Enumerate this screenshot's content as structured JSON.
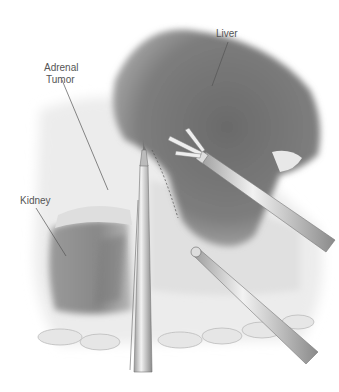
{
  "figure": {
    "type": "anatomical-surgical-illustration",
    "labels": {
      "liver": "Liver",
      "adrenal_tumor_line1": "Adrenal",
      "adrenal_tumor_line2": "Tumor",
      "kidney": "Kidney"
    },
    "colors": {
      "background": "#ffffff",
      "organ_dark": "#6e6e6e",
      "organ_mid": "#9a9a9a",
      "tissue_light": "#e4e4e4",
      "instrument": "#cfcfcf",
      "label_text": "#555555"
    }
  }
}
